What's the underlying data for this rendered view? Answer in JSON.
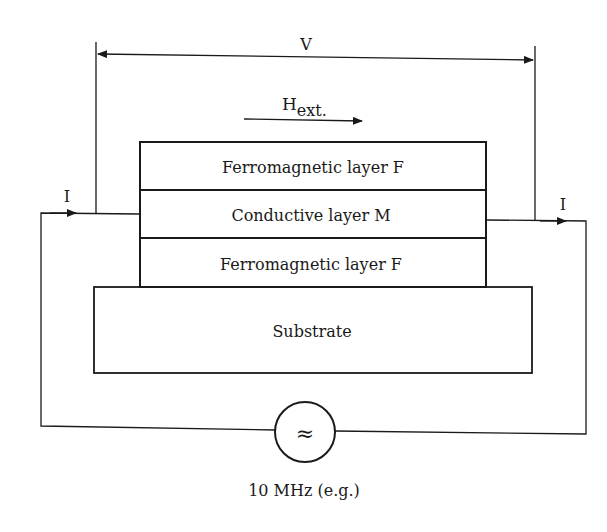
{
  "diagram": {
    "type": "GMR sensor measurement setup",
    "voltage_label": "V",
    "field_label": {
      "main": "H",
      "subscript": "ext."
    },
    "current_left_label": "I",
    "current_right_label": "I",
    "layers": [
      {
        "label": "Ferromagnetic layer F"
      },
      {
        "label": "Conductive layer M"
      },
      {
        "label": "Ferromagnetic layer F"
      }
    ],
    "substrate_label": "Substrate",
    "source_symbol": "≈",
    "source_caption": "10 MHz (e.g.)",
    "colors": {
      "line": "#1a1a1a",
      "background": "#ffffff"
    }
  }
}
